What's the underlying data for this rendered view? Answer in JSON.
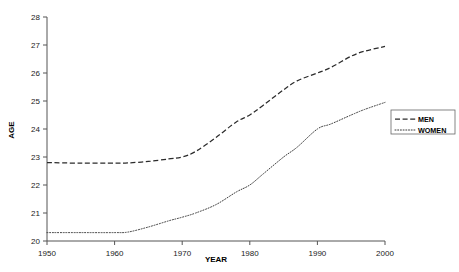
{
  "chart_data": {
    "type": "line",
    "title": "",
    "xlabel": "YEAR",
    "ylabel": "AGE",
    "xlim": [
      1950,
      2000
    ],
    "ylim": [
      20,
      28
    ],
    "grid": false,
    "legend_position": "right",
    "xticks": [
      1950,
      1960,
      1970,
      1980,
      1990,
      2000
    ],
    "yticks": [
      20,
      21,
      22,
      23,
      24,
      25,
      26,
      27,
      28
    ],
    "x": [
      1950,
      1955,
      1960,
      1962,
      1965,
      1968,
      1970,
      1972,
      1975,
      1978,
      1980,
      1982,
      1985,
      1987,
      1990,
      1992,
      1995,
      1997,
      2000
    ],
    "series": [
      {
        "name": "MEN",
        "style": "dashed",
        "color": "#2b2b2b",
        "values": [
          22.8,
          22.78,
          22.78,
          22.79,
          22.84,
          22.93,
          23.0,
          23.2,
          23.7,
          24.25,
          24.5,
          24.85,
          25.4,
          25.72,
          26.0,
          26.2,
          26.6,
          26.78,
          26.95
        ]
      },
      {
        "name": "WOMEN",
        "style": "dotted",
        "color": "#3a3a3a",
        "values": [
          20.3,
          20.3,
          20.3,
          20.32,
          20.5,
          20.72,
          20.85,
          21.0,
          21.3,
          21.75,
          22.0,
          22.4,
          23.0,
          23.35,
          24.0,
          24.18,
          24.5,
          24.7,
          24.95
        ]
      }
    ]
  },
  "legend": {
    "items": [
      {
        "label": "MEN",
        "style": "dashed"
      },
      {
        "label": "WOMEN",
        "style": "dotted"
      }
    ]
  }
}
